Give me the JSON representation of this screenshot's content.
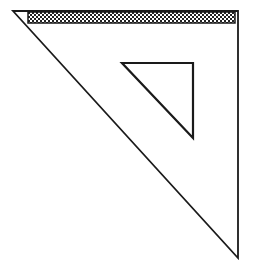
{
  "figure": {
    "stroke_color": "#1a1a1a",
    "background_color": "#ffffff",
    "outer_triangle": {
      "points": [
        [
          13,
          11
        ],
        [
          238,
          11
        ],
        [
          238,
          258
        ]
      ]
    },
    "inner_cutout": {
      "points": [
        [
          122,
          63
        ],
        [
          193,
          63
        ],
        [
          193,
          138
        ]
      ]
    },
    "hatched_edge": {
      "x": 28,
      "y": 12,
      "width": 207,
      "height": 11
    }
  }
}
